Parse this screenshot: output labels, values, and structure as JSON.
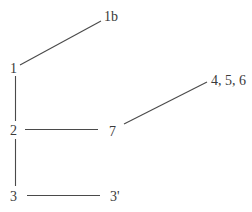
{
  "diagram": {
    "type": "tree",
    "nodes": [
      {
        "id": "1",
        "label": "1",
        "x": 13,
        "y": 73
      },
      {
        "id": "1b",
        "label": "1b",
        "x": 104,
        "y": 21
      },
      {
        "id": "2",
        "label": "2",
        "x": 13,
        "y": 135
      },
      {
        "id": "7",
        "label": "7",
        "x": 109,
        "y": 136
      },
      {
        "id": "456",
        "label": "4, 5, 6",
        "x": 212,
        "y": 85
      },
      {
        "id": "3",
        "label": "3",
        "x": 13,
        "y": 201
      },
      {
        "id": "3p",
        "label": "3'",
        "x": 111,
        "y": 201
      }
    ],
    "edges": [
      {
        "from": "1",
        "to": "1b"
      },
      {
        "from": "1",
        "to": "2"
      },
      {
        "from": "2",
        "to": "7"
      },
      {
        "from": "7",
        "to": "456"
      },
      {
        "from": "2",
        "to": "3"
      },
      {
        "from": "3",
        "to": "3p"
      }
    ],
    "colors": {
      "line": "#4a4a4a",
      "text": "#3a3a3a",
      "background": "#ffffff"
    }
  }
}
